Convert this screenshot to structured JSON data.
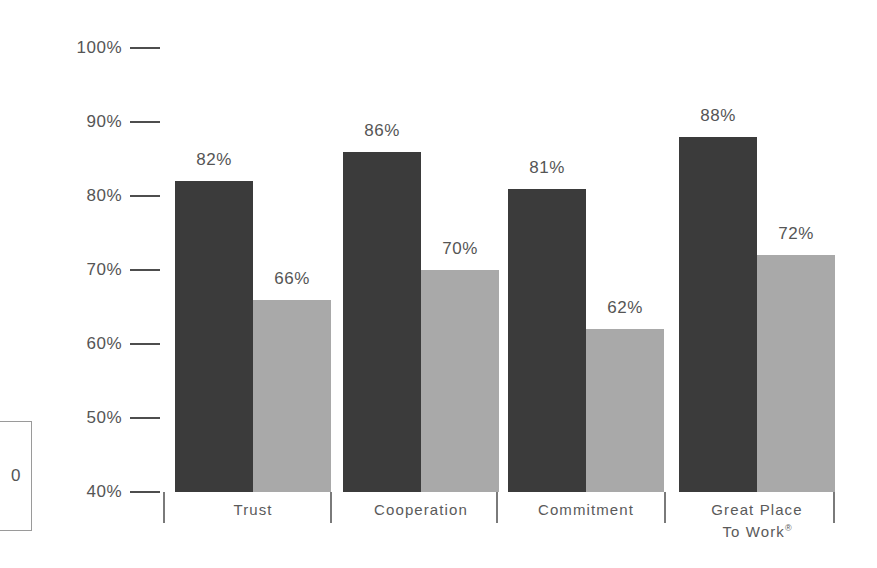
{
  "chart_data": {
    "type": "bar",
    "title": "",
    "subtitle": "",
    "xlabel": "",
    "ylabel": "",
    "categories": [
      "Trust",
      "Cooperation",
      "Commitment",
      "Great Place\nTo Work®"
    ],
    "series": [
      {
        "name": "dark-series",
        "color": "#3b3b3b",
        "values": [
          82,
          86,
          81,
          88
        ]
      },
      {
        "name": "light-series",
        "color": "#a9a9a9",
        "values": [
          66,
          70,
          62,
          72
        ]
      }
    ],
    "value_labels": [
      [
        "82%",
        "66%"
      ],
      [
        "86%",
        "70%"
      ],
      [
        "81%",
        "62%"
      ],
      [
        "88%",
        "72%"
      ]
    ],
    "ylim": [
      40,
      100
    ],
    "ytick_labels": [
      "100%",
      "90%",
      "80%",
      "70%",
      "60%",
      "50%",
      "40%"
    ],
    "ytick_values": [
      100,
      90,
      80,
      70,
      60,
      50,
      40
    ],
    "grid": false,
    "legend": "none",
    "axis_tick_style": "dash",
    "group_separators": true
  },
  "axis": {
    "ticks": [
      {
        "label": "100%",
        "value": 100
      },
      {
        "label": "90%",
        "value": 90
      },
      {
        "label": "80%",
        "value": 80
      },
      {
        "label": "70%",
        "value": 70
      },
      {
        "label": "60%",
        "value": 60
      },
      {
        "label": "50%",
        "value": 50
      },
      {
        "label": "40%",
        "value": 40
      }
    ]
  },
  "groups": [
    {
      "label_lines": [
        "Trust"
      ],
      "bars": [
        {
          "value": 82,
          "label": "82%",
          "shade": "dark"
        },
        {
          "value": 66,
          "label": "66%",
          "shade": "light"
        }
      ]
    },
    {
      "label_lines": [
        "Cooperation"
      ],
      "bars": [
        {
          "value": 86,
          "label": "86%",
          "shade": "dark"
        },
        {
          "value": 70,
          "label": "70%",
          "shade": "light"
        }
      ]
    },
    {
      "label_lines": [
        "Commitment"
      ],
      "bars": [
        {
          "value": 81,
          "label": "81%",
          "shade": "dark"
        },
        {
          "value": 62,
          "label": "62%",
          "shade": "light"
        }
      ]
    },
    {
      "label_lines": [
        "Great Place",
        "To Work®"
      ],
      "bars": [
        {
          "value": 88,
          "label": "88%",
          "shade": "dark"
        },
        {
          "value": 72,
          "label": "72%",
          "shade": "light"
        }
      ]
    }
  ],
  "side_box": {
    "text": "0"
  },
  "colors": {
    "dark_bar": "#3b3b3b",
    "light_bar": "#a9a9a9",
    "text": "#555555",
    "axis": "#4d4d4d",
    "background": "#ffffff"
  }
}
